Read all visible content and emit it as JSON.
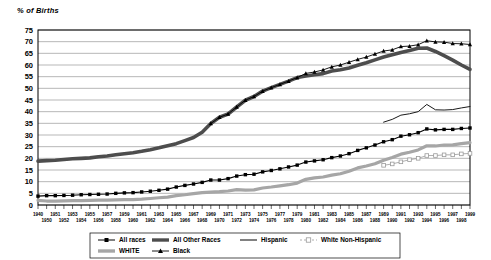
{
  "chart_data": {
    "type": "line",
    "title": "",
    "ylabel": "% of Births",
    "xlabel": "",
    "ylim": [
      0,
      75
    ],
    "yticks": [
      0,
      5,
      10,
      15,
      20,
      25,
      30,
      35,
      40,
      45,
      50,
      55,
      60,
      65,
      70,
      75
    ],
    "grid": true,
    "legend_position": "bottom",
    "x": [
      1940,
      1950,
      1951,
      1952,
      1953,
      1954,
      1955,
      1956,
      1957,
      1958,
      1959,
      1960,
      1961,
      1962,
      1963,
      1964,
      1965,
      1966,
      1967,
      1968,
      1969,
      1970,
      1971,
      1972,
      1973,
      1974,
      1975,
      1976,
      1977,
      1978,
      1979,
      1980,
      1981,
      1982,
      1983,
      1984,
      1985,
      1986,
      1987,
      1988,
      1989,
      1990,
      1991,
      1992,
      1993,
      1994,
      1995,
      1996,
      1997,
      1998,
      1999
    ],
    "categories": [
      "1940",
      "1950",
      "1951",
      "1952",
      "1953",
      "1954",
      "1955",
      "1956",
      "1957",
      "1958",
      "1959",
      "1960",
      "1961",
      "1962",
      "1963",
      "1964",
      "1965",
      "1966",
      "1967",
      "1968",
      "1969",
      "1970",
      "1971",
      "1972",
      "1973",
      "1974",
      "1975",
      "1976",
      "1977",
      "1978",
      "1979",
      "1980",
      "1981",
      "1982",
      "1983",
      "1984",
      "1985",
      "1986",
      "1987",
      "1988",
      "1989",
      "1990",
      "1991",
      "1992",
      "1993",
      "1994",
      "1995",
      "1996",
      "1997",
      "1998",
      "1999"
    ],
    "xticklabels_top": [
      "1940",
      "1951",
      "1953",
      "1955",
      "1957",
      "1959",
      "1961",
      "1963",
      "1965",
      "1967",
      "1969",
      "1971",
      "1973",
      "1975",
      "1977",
      "1979",
      "1981",
      "1983",
      "1985",
      "1987",
      "1989",
      "1991",
      "1993",
      "1995",
      "1997",
      "1999"
    ],
    "xticklabels_bottom": [
      "1950",
      "1952",
      "1954",
      "1956",
      "1958",
      "1960",
      "1962",
      "1964",
      "1966",
      "1968",
      "1970",
      "1972",
      "1974",
      "1976",
      "1978",
      "1980",
      "1982",
      "1984",
      "1986",
      "1988",
      "1990",
      "1992",
      "1994",
      "1996",
      "1998"
    ],
    "series": [
      {
        "name": "All races",
        "style": "line-square",
        "color": "#000000",
        "marker": "square",
        "width": 1.1,
        "values": [
          3.8,
          4.0,
          4.0,
          4.1,
          4.2,
          4.4,
          4.5,
          4.6,
          4.7,
          5.0,
          5.2,
          5.3,
          5.6,
          5.9,
          6.3,
          6.8,
          7.7,
          8.4,
          9.0,
          9.7,
          10.7,
          10.7,
          11.3,
          12.4,
          13.0,
          13.2,
          14.2,
          14.8,
          15.5,
          16.3,
          17.1,
          18.4,
          18.9,
          19.4,
          20.3,
          21.0,
          22.0,
          23.4,
          24.5,
          25.7,
          27.1,
          28.0,
          29.5,
          30.1,
          31.0,
          32.6,
          32.2,
          32.4,
          32.4,
          32.8,
          33.0
        ]
      },
      {
        "name": "All Other Races",
        "style": "thick-line",
        "color": "#4d4d4d",
        "marker": "none",
        "width": 3.6,
        "values": [
          18.8,
          19.0,
          19.2,
          19.5,
          19.8,
          20.0,
          20.2,
          20.7,
          21.0,
          21.5,
          22.0,
          22.4,
          23.0,
          23.7,
          24.5,
          25.4,
          26.3,
          27.6,
          28.9,
          31.2,
          34.9,
          37.6,
          39.0,
          42.0,
          44.9,
          46.5,
          48.8,
          50.3,
          51.7,
          53.1,
          54.6,
          55.3,
          55.8,
          56.3,
          57.4,
          58.0,
          58.7,
          59.9,
          61.0,
          62.2,
          63.4,
          64.4,
          65.4,
          66.2,
          67.2,
          67.3,
          65.8,
          64.0,
          62.1,
          60.0,
          58.1
        ]
      },
      {
        "name": "Hispanic",
        "style": "thin-line",
        "color": "#1a1a1a",
        "marker": "none",
        "width": 1.0,
        "values": [
          null,
          null,
          null,
          null,
          null,
          null,
          null,
          null,
          null,
          null,
          null,
          null,
          null,
          null,
          null,
          null,
          null,
          null,
          null,
          null,
          null,
          null,
          null,
          null,
          null,
          null,
          null,
          null,
          null,
          null,
          null,
          null,
          null,
          null,
          null,
          null,
          null,
          null,
          null,
          null,
          35.5,
          36.7,
          38.5,
          39.1,
          40.0,
          43.1,
          40.8,
          40.7,
          40.9,
          41.6,
          42.2
        ]
      },
      {
        "name": "White Non-Hispanic",
        "style": "open-square",
        "color": "#9a9a9a",
        "marker": "open-square",
        "width": 0.8,
        "values": [
          null,
          null,
          null,
          null,
          null,
          null,
          null,
          null,
          null,
          null,
          null,
          null,
          null,
          null,
          null,
          null,
          null,
          null,
          null,
          null,
          null,
          null,
          null,
          null,
          null,
          null,
          null,
          null,
          null,
          null,
          null,
          null,
          null,
          null,
          null,
          null,
          null,
          null,
          null,
          null,
          17.0,
          17.6,
          18.5,
          19.4,
          20.0,
          21.2,
          21.2,
          21.5,
          21.5,
          21.9,
          22.1
        ]
      },
      {
        "name": "WHITE",
        "style": "thick-line",
        "color": "#a6a6a6",
        "marker": "none",
        "width": 3.2,
        "values": [
          2.0,
          1.7,
          1.7,
          1.8,
          1.9,
          1.9,
          2.0,
          2.1,
          2.1,
          2.2,
          2.3,
          2.3,
          2.5,
          2.8,
          3.1,
          3.4,
          4.0,
          4.4,
          4.9,
          5.3,
          5.5,
          5.7,
          6.0,
          6.6,
          6.4,
          6.5,
          7.3,
          7.7,
          8.2,
          8.7,
          9.4,
          11.0,
          11.6,
          12.0,
          12.8,
          13.4,
          14.5,
          15.9,
          16.7,
          17.7,
          19.2,
          20.4,
          21.8,
          22.6,
          23.6,
          25.4,
          25.3,
          25.7,
          25.8,
          26.3,
          26.7
        ]
      },
      {
        "name": "Black",
        "style": "line-triangle",
        "color": "#000000",
        "marker": "triangle",
        "width": 0.9,
        "values": [
          null,
          null,
          null,
          null,
          null,
          null,
          null,
          null,
          null,
          null,
          null,
          null,
          null,
          null,
          null,
          null,
          null,
          null,
          null,
          null,
          34.9,
          37.6,
          39.0,
          42.0,
          44.9,
          46.5,
          48.8,
          50.3,
          51.7,
          53.1,
          54.6,
          56.4,
          57.0,
          57.9,
          59.2,
          60.0,
          61.2,
          62.4,
          63.4,
          64.7,
          66.0,
          66.5,
          67.9,
          68.1,
          68.7,
          70.4,
          69.9,
          69.8,
          69.2,
          69.1,
          68.8
        ]
      }
    ],
    "legend": [
      {
        "label": "All races",
        "marker": "square",
        "color": "#000000"
      },
      {
        "label": "All Other Races",
        "marker": "thick",
        "color": "#4d4d4d"
      },
      {
        "label": "Hispanic",
        "marker": "thin",
        "color": "#1a1a1a"
      },
      {
        "label": "White Non-Hispanic",
        "marker": "open-square",
        "color": "#9a9a9a"
      },
      {
        "label": "WHITE",
        "marker": "thick",
        "color": "#a6a6a6"
      },
      {
        "label": "Black",
        "marker": "triangle",
        "color": "#000000"
      }
    ]
  }
}
